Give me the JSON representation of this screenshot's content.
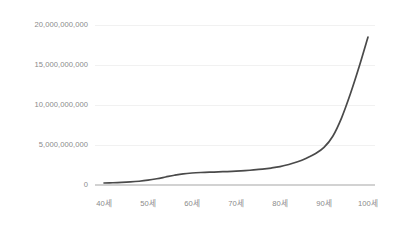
{
  "chart_data": {
    "type": "line",
    "title": "",
    "subtitle": "",
    "xlabel": "",
    "ylabel": "",
    "grid": true,
    "legend": false,
    "legend_position": "none",
    "line_color": "#4a4a4a",
    "grid_color": "#ededed",
    "axis_color": "#d2d2d2",
    "tick_label_color": "#8a8a8a",
    "background_color": "#ffffff",
    "xlim": [
      40,
      100
    ],
    "ylim": [
      0,
      20000000000
    ],
    "x_tick_labels": [
      "40세",
      "50세",
      "60세",
      "70세",
      "80세",
      "90세",
      "100세"
    ],
    "x_tick_values": [
      40,
      50,
      60,
      70,
      80,
      90,
      100
    ],
    "y_tick_labels": [
      "0",
      "5,000,000,000",
      "10,000,000,000",
      "15,000,000,000",
      "20,000,000,000"
    ],
    "y_tick_values": [
      0,
      5000000000,
      10000000000,
      15000000000,
      20000000000
    ],
    "series": [
      {
        "name": "",
        "x": [
          40,
          42,
          44,
          46,
          48,
          50,
          52,
          54,
          56,
          58,
          60,
          62,
          64,
          66,
          68,
          70,
          72,
          74,
          76,
          78,
          80,
          82,
          84,
          86,
          88,
          90,
          92,
          94,
          96,
          98,
          100
        ],
        "values": [
          250000000,
          280000000,
          320000000,
          380000000,
          470000000,
          600000000,
          780000000,
          1000000000,
          1220000000,
          1400000000,
          1500000000,
          1560000000,
          1600000000,
          1640000000,
          1680000000,
          1730000000,
          1800000000,
          1880000000,
          1980000000,
          2120000000,
          2300000000,
          2560000000,
          2900000000,
          3350000000,
          3900000000,
          4700000000,
          6100000000,
          8400000000,
          11400000000,
          14800000000,
          18500000000
        ]
      }
    ]
  }
}
